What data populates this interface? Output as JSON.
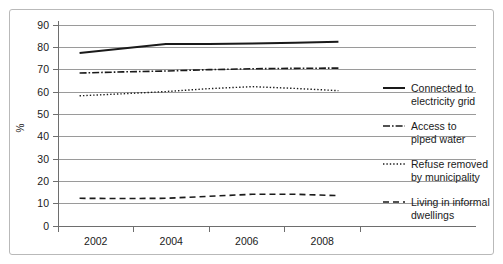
{
  "chart_data": {
    "type": "line",
    "title": "",
    "subtitle": "",
    "xlabel": "",
    "ylabel": "%",
    "x": [
      2002,
      2003,
      2004,
      2005,
      2006,
      2007,
      2008
    ],
    "xlim": [
      2001.5,
      2008.5
    ],
    "ylim": [
      0,
      90
    ],
    "yticks": [
      0,
      10,
      20,
      30,
      40,
      50,
      60,
      70,
      80,
      90
    ],
    "xticks_labels": [
      "2002",
      "2004",
      "2006",
      "2008"
    ],
    "grid": "horizontal",
    "legend_position": "right",
    "series": [
      {
        "name": "Connected to electricity grid",
        "style": "solid",
        "values": [
          77.5,
          79.5,
          81.5,
          81.5,
          81.7,
          82.0,
          82.5
        ]
      },
      {
        "name": "Access to piped water",
        "style": "dash-dot",
        "values": [
          68.5,
          69.0,
          69.4,
          70.0,
          70.4,
          70.6,
          70.7
        ]
      },
      {
        "name": "Refuse removed by municipality",
        "style": "dotted",
        "values": [
          58.3,
          59.2,
          60.2,
          61.5,
          62.4,
          61.6,
          60.6
        ]
      },
      {
        "name": "Living in informal dwellings",
        "style": "dashed",
        "values": [
          12.4,
          12.3,
          12.4,
          13.3,
          14.2,
          14.2,
          13.6
        ]
      }
    ]
  },
  "axes": {
    "y_label": "%",
    "y_tick_labels": [
      "90",
      "80",
      "70",
      "60",
      "50",
      "40",
      "30",
      "20",
      "10",
      "0"
    ],
    "x_tick_labels": [
      "2002",
      "2004",
      "2006",
      "2008"
    ]
  },
  "legend": {
    "entries": [
      {
        "line1": "Connected to",
        "line2": "electricity grid",
        "style": "solid"
      },
      {
        "line1": "Access to",
        "line2": "piped water",
        "style": "dash-dot"
      },
      {
        "line1": "Refuse removed",
        "line2": "by municipality",
        "style": "dotted"
      },
      {
        "line1": "Living in informal",
        "line2": "dwellings",
        "style": "dashed"
      }
    ]
  },
  "colors": {
    "line": "#1a1a1a",
    "grid": "#9a9a9a",
    "axis": "#6e6e6e",
    "border": "#b9b9b9",
    "background": "#ffffff"
  }
}
